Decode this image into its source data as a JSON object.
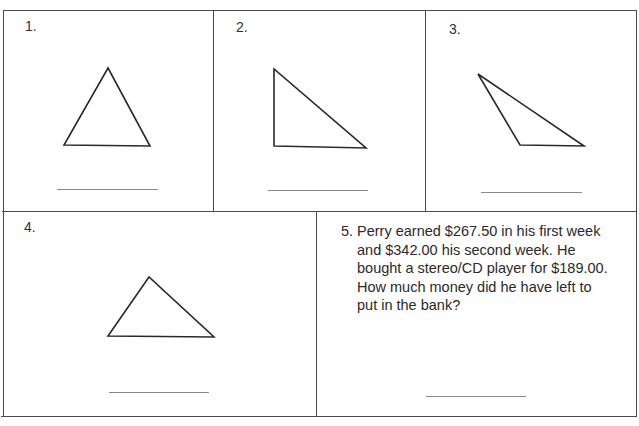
{
  "worksheet": {
    "problems": [
      {
        "number": "1.",
        "type": "triangle",
        "shape": "acute-isosceles",
        "vertices": [
          [
            108,
            68
          ],
          [
            64,
            145
          ],
          [
            150,
            146
          ]
        ]
      },
      {
        "number": "2.",
        "type": "triangle",
        "shape": "right",
        "vertices": [
          [
            274,
            69
          ],
          [
            274,
            146
          ],
          [
            366,
            148
          ]
        ]
      },
      {
        "number": "3.",
        "type": "triangle",
        "shape": "obtuse",
        "vertices": [
          [
            478,
            74
          ],
          [
            520,
            145
          ],
          [
            584,
            146
          ]
        ]
      },
      {
        "number": "4.",
        "type": "triangle",
        "shape": "scalene",
        "vertices": [
          [
            149,
            277
          ],
          [
            108,
            336
          ],
          [
            214,
            337
          ]
        ]
      },
      {
        "number": "5.",
        "type": "word-problem",
        "text_lines": [
          "Perry earned $267.50 in his first week",
          "and $342.00 his second week.  He",
          "bought a stereo/CD player for $189.00.",
          "How much money did he have left to",
          "put in the bank?"
        ]
      }
    ],
    "border_color": "#4a4a4a",
    "answer_line_color": "#8a8a8a"
  }
}
